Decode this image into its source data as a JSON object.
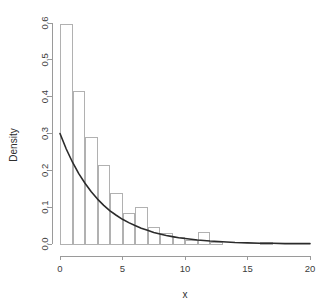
{
  "figure": {
    "background_color": "#ffffff",
    "width": 326,
    "height": 308
  },
  "chart_data": {
    "type": "bar",
    "title": "",
    "subtitle": "",
    "xlabel": "x",
    "ylabel": "Density",
    "xlim": [
      0,
      20
    ],
    "ylim": [
      0,
      0.6
    ],
    "grid": false,
    "legend": null,
    "bin_width": 1,
    "axis_color": "#9a9a9a",
    "bar_fill_color": "#ffffff",
    "bar_stroke_color": "#a8a8a8",
    "curve_color": "#2b2b2b",
    "x_ticks": [
      0,
      5,
      10,
      15,
      20
    ],
    "x_tick_labels": [
      "0",
      "5",
      "10",
      "15",
      "20"
    ],
    "y_ticks": [
      0.0,
      0.1,
      0.2,
      0.3,
      0.4,
      0.5,
      0.6
    ],
    "y_tick_labels": [
      "0.0",
      "0.1",
      "0.2",
      "0.3",
      "0.4",
      "0.5",
      "0.6"
    ],
    "categories": [
      0,
      1,
      2,
      3,
      4,
      5,
      6,
      7,
      8,
      9,
      10,
      11,
      12,
      13,
      14,
      15,
      16,
      17,
      18,
      19
    ],
    "bin_edges": [
      0,
      1,
      2,
      3,
      4,
      5,
      6,
      7,
      8,
      9,
      10,
      11,
      12,
      13,
      14,
      15,
      16,
      17,
      18,
      19,
      20
    ],
    "values": [
      0.595,
      0.415,
      0.29,
      0.213,
      0.137,
      0.083,
      0.1,
      0.044,
      0.028,
      0.017,
      0.01,
      0.031,
      0.004,
      0.0,
      0.0,
      0.0,
      0.004,
      0.0,
      0.0,
      0.0
    ],
    "series": [
      {
        "name": "Histogram",
        "kind": "bar",
        "values": [
          0.595,
          0.415,
          0.29,
          0.213,
          0.137,
          0.083,
          0.1,
          0.044,
          0.028,
          0.017,
          0.01,
          0.031,
          0.004,
          0.0,
          0.0,
          0.0,
          0.004,
          0.0,
          0.0,
          0.0
        ]
      },
      {
        "name": "Exponential density curve",
        "kind": "line",
        "x": [
          0,
          0.5,
          1,
          1.5,
          2,
          2.5,
          3,
          3.5,
          4,
          4.5,
          5,
          5.5,
          6,
          6.5,
          7,
          7.5,
          8,
          8.5,
          9,
          9.5,
          10,
          11,
          12,
          13,
          14,
          15,
          16,
          17,
          18,
          19,
          20
        ],
        "y": [
          0.3,
          0.258,
          0.222,
          0.191,
          0.165,
          0.142,
          0.122,
          0.105,
          0.09,
          0.078,
          0.067,
          0.058,
          0.05,
          0.043,
          0.037,
          0.031,
          0.027,
          0.023,
          0.02,
          0.017,
          0.015,
          0.011,
          0.008,
          0.006,
          0.004,
          0.003,
          0.002,
          0.002,
          0.001,
          0.001,
          0.001
        ]
      }
    ]
  }
}
